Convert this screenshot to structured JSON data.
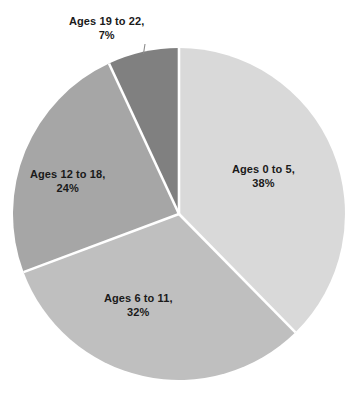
{
  "chart_data": {
    "type": "pie",
    "title": "",
    "subtitle": "",
    "xlabel": "",
    "ylabel": "",
    "grid": false,
    "legend": "none",
    "label_format": "{name}, {value}%",
    "start_angle_deg": 0,
    "direction": "clockwise",
    "categories": [
      "Ages 0 to 5",
      "Ages 6 to 11",
      "Ages 12 to 18",
      "Ages 19 to 22"
    ],
    "values": [
      38,
      32,
      24,
      7
    ],
    "colors": [
      "#d9d9d9",
      "#bfbfbf",
      "#a6a6a6",
      "#808080"
    ],
    "separator_color": "#ffffff",
    "leader_line_color": "#8c8c8c",
    "slices": [
      {
        "name": "Ages 0 to 5",
        "value": 38,
        "percent_text": "38%",
        "name_text": "Ages 0 to 5,",
        "color": "#d9d9d9",
        "label_placement": "inside"
      },
      {
        "name": "Ages 6 to 11",
        "value": 32,
        "percent_text": "32%",
        "name_text": "Ages 6 to 11,",
        "color": "#bfbfbf",
        "label_placement": "inside"
      },
      {
        "name": "Ages 12 to 18",
        "value": 24,
        "percent_text": "24%",
        "name_text": "Ages 12 to 18,",
        "color": "#a6a6a6",
        "label_placement": "inside"
      },
      {
        "name": "Ages 19 to 22",
        "value": 7,
        "percent_text": "7%",
        "name_text": "Ages 19 to 22,",
        "color": "#808080",
        "label_placement": "outside-with-leader"
      }
    ]
  }
}
